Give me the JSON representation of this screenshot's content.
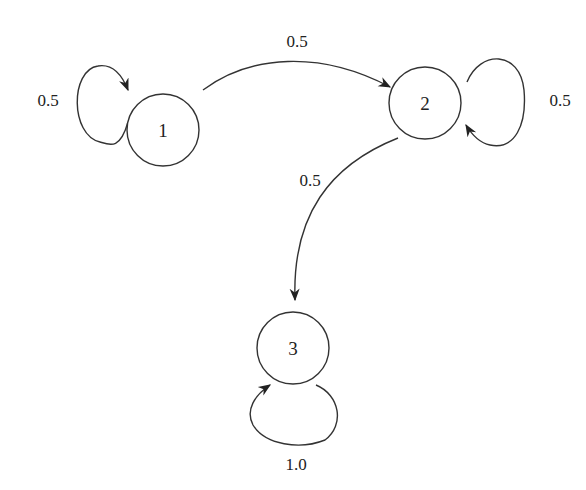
{
  "diagram": {
    "type": "markov-chain-state-diagram",
    "nodes": [
      {
        "id": "1",
        "label": "1"
      },
      {
        "id": "2",
        "label": "2"
      },
      {
        "id": "3",
        "label": "3"
      }
    ],
    "edges": [
      {
        "from": "1",
        "to": "1",
        "label": "0.5"
      },
      {
        "from": "1",
        "to": "2",
        "label": "0.5"
      },
      {
        "from": "2",
        "to": "2",
        "label": "0.5"
      },
      {
        "from": "2",
        "to": "3",
        "label": "0.5"
      },
      {
        "from": "3",
        "to": "3",
        "label": "1.0"
      }
    ]
  }
}
